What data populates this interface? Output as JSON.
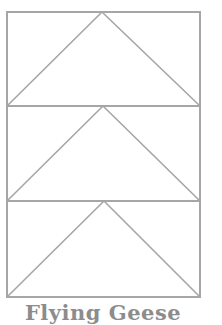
{
  "diagram": {
    "title": "Flying Geese",
    "stroke_color": "#a6a6a6",
    "caption_color": "#8c8c8c",
    "outer": {
      "x": 7,
      "y": 12,
      "width": 193,
      "height": 285
    },
    "units": [
      {
        "label": "goose-1",
        "top": 12,
        "bottom": 106,
        "left": 7,
        "right": 200,
        "apex_x": 102
      },
      {
        "label": "goose-2",
        "top": 106,
        "bottom": 201,
        "left": 7,
        "right": 200,
        "apex_x": 103
      },
      {
        "label": "goose-3",
        "top": 201,
        "bottom": 297,
        "left": 7,
        "right": 200,
        "apex_x": 104
      }
    ]
  }
}
